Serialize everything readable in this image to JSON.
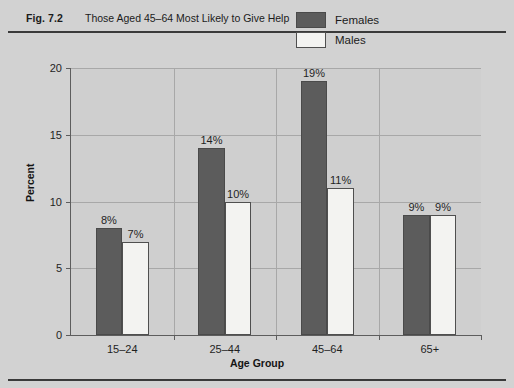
{
  "figure": {
    "number": "Fig. 7.2",
    "caption": "Those Aged 45–64 Most Likely to Give Help"
  },
  "chart_data": {
    "type": "bar",
    "title": "Those Aged 45–64 Most Likely to Give Help",
    "xlabel": "Age Group",
    "ylabel": "Percent",
    "categories": [
      "15–24",
      "25–44",
      "45–64",
      "65+"
    ],
    "series": [
      {
        "name": "Females",
        "values": [
          8,
          14,
          19,
          9
        ],
        "color": "#5c5c5c"
      },
      {
        "name": "Males",
        "values": [
          7,
          10,
          11,
          9
        ],
        "color": "#f3f3f1"
      }
    ],
    "data_labels": {
      "Females": [
        "8%",
        "14%",
        "19%",
        "9%"
      ],
      "Males": [
        "7%",
        "10%",
        "11%",
        "9%"
      ]
    },
    "ylim": [
      0,
      20
    ],
    "yticks": [
      0,
      5,
      10,
      15,
      20
    ],
    "ytick_labels": [
      "0",
      "5",
      "10",
      "15",
      "20"
    ],
    "grid": true,
    "legend_position": "top-right",
    "plot_background": "#cfcfcf",
    "page_background": "#d2d2d2"
  },
  "legend": {
    "entries": [
      {
        "label": "Females"
      },
      {
        "label": "Males"
      }
    ]
  }
}
